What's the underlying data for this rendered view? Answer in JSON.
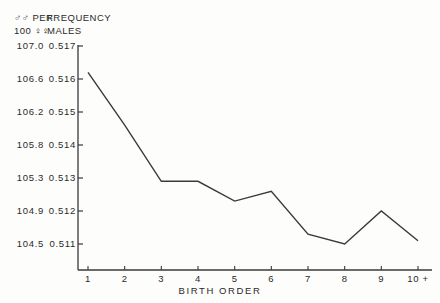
{
  "axis_headers": {
    "left_line1": "♂♂ PER",
    "left_line2": "100 ♀♀",
    "right_line1": "FREQUENCY",
    "right_line2": "MALES"
  },
  "xlabel": "BIRTH  ORDER",
  "y_left_ticks": [
    "107.0",
    "106.6",
    "106.2",
    "105.8",
    "105.3",
    "104.9",
    "104.5"
  ],
  "y_right_ticks": [
    "0.517",
    "0.516",
    "0.515",
    "0.514",
    "0.513",
    "0.512",
    "0.511"
  ],
  "x_ticks": [
    "1",
    "2",
    "3",
    "4",
    "5",
    "6",
    "7",
    "8",
    "9",
    "10 +"
  ],
  "colors": {
    "line": "#3a3a3a",
    "axis": "#3a3a3a",
    "text": "#2a2a2a",
    "background": "#fdfdfc"
  },
  "chart_data": {
    "type": "line",
    "title": "",
    "xlabel": "BIRTH  ORDER",
    "ylabel": "FREQUENCY MALES",
    "ylabel_secondary": "♂♂ PER 100 ♀♀",
    "grid": false,
    "legend": "none",
    "categories": [
      "1",
      "2",
      "3",
      "4",
      "5",
      "6",
      "7",
      "8",
      "9",
      "10 +"
    ],
    "x": [
      1,
      2,
      3,
      4,
      5,
      6,
      7,
      8,
      9,
      10
    ],
    "values": [
      0.5162,
      0.5146,
      0.5129,
      0.5129,
      0.5123,
      0.5126,
      0.5113,
      0.511,
      0.512,
      0.5111
    ],
    "values_sex_ratio": [
      106.7,
      106.0,
      105.3,
      105.3,
      105.0,
      105.1,
      104.6,
      104.5,
      104.9,
      104.5
    ],
    "ylim": [
      0.5104,
      0.517
    ],
    "ylim_secondary": [
      104.3,
      107.0
    ],
    "ytick_values": [
      0.517,
      0.516,
      0.515,
      0.514,
      0.513,
      0.512,
      0.511
    ],
    "ytick_values_secondary": [
      107.0,
      106.6,
      106.2,
      105.8,
      105.3,
      104.9,
      104.5
    ],
    "xlim": [
      0.6,
      10.4
    ]
  }
}
